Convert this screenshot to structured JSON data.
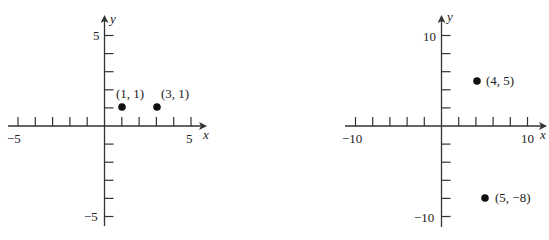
{
  "chart_data": [
    {
      "type": "scatter",
      "title": "",
      "xlabel": "x",
      "ylabel": "y",
      "xlim": [
        -5,
        5
      ],
      "ylim": [
        -5,
        5
      ],
      "x_tick_step": 1,
      "y_tick_step": 1,
      "x_tick_labels": [
        "−5",
        "5"
      ],
      "y_tick_labels": [
        "5",
        "−5"
      ],
      "grid": false,
      "points": [
        {
          "x": 1,
          "y": 1,
          "label": "(1, 1)"
        },
        {
          "x": 3,
          "y": 1,
          "label": "(3, 1)"
        }
      ]
    },
    {
      "type": "scatter",
      "title": "",
      "xlabel": "x",
      "ylabel": "y",
      "xlim": [
        -10,
        10
      ],
      "ylim": [
        -10,
        10
      ],
      "x_tick_step": 2,
      "y_tick_step": 2,
      "x_tick_labels": [
        "−10",
        "10"
      ],
      "y_tick_labels": [
        "10",
        "−10"
      ],
      "grid": false,
      "points": [
        {
          "x": 4,
          "y": 5,
          "label": "(4, 5)"
        },
        {
          "x": 5,
          "y": -8,
          "label": "(5, −8)"
        }
      ]
    }
  ]
}
